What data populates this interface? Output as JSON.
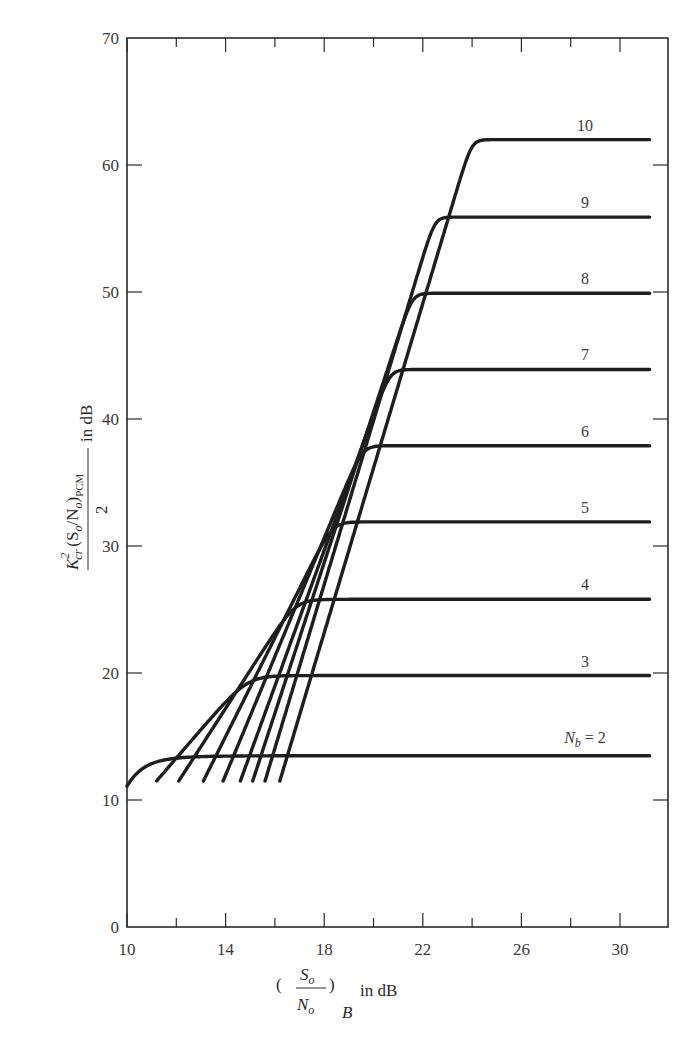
{
  "chart_data": {
    "type": "line",
    "title": "",
    "xlabel": "(S_o / N_o)_B in dB",
    "ylabel": "K_cr^2 (S_o/N_o)_PCM / 2 in dB",
    "xlim": [
      10,
      32
    ],
    "ylim": [
      0,
      70
    ],
    "x_ticks": [
      10,
      14,
      18,
      22,
      26,
      30
    ],
    "x_minor_ticks": [
      12,
      16,
      20,
      24,
      28
    ],
    "y_ticks": [
      0,
      10,
      20,
      30,
      40,
      50,
      60,
      70
    ],
    "grid": false,
    "legend": "inline labels above each plateau",
    "series": [
      {
        "name": "N_b = 2",
        "label": "N_b = 2",
        "x_start": 10.0,
        "y_start": 11.2,
        "x_knee": 13.5,
        "plateau": 13.8,
        "x_end": 31.2
      },
      {
        "name": "3",
        "label": "3",
        "x_start": 11.2,
        "y_start": 11.5,
        "x_knee": 15.7,
        "plateau": 19.8,
        "x_end": 31.2
      },
      {
        "name": "4",
        "label": "4",
        "x_start": 12.1,
        "y_start": 11.5,
        "x_knee": 17.9,
        "plateau": 25.8,
        "x_end": 31.2
      },
      {
        "name": "5",
        "label": "5",
        "x_start": 13.1,
        "y_start": 11.5,
        "x_knee": 19.5,
        "plateau": 31.9,
        "x_end": 31.2
      },
      {
        "name": "6",
        "label": "6",
        "x_start": 13.9,
        "y_start": 11.5,
        "x_knee": 20.8,
        "plateau": 37.9,
        "x_end": 31.2
      },
      {
        "name": "7",
        "label": "7",
        "x_start": 14.6,
        "y_start": 11.5,
        "x_knee": 22.0,
        "plateau": 43.9,
        "x_end": 31.2
      },
      {
        "name": "8",
        "label": "8",
        "x_start": 15.1,
        "y_start": 11.5,
        "x_knee": 23.0,
        "plateau": 49.9,
        "x_end": 31.2
      },
      {
        "name": "9",
        "label": "9",
        "x_start": 15.6,
        "y_start": 11.5,
        "x_knee": 24.0,
        "plateau": 55.9,
        "x_end": 31.2
      },
      {
        "name": "10",
        "label": "10",
        "x_start": 16.2,
        "y_start": 11.5,
        "x_knee": 25.7,
        "plateau": 62.0,
        "x_end": 31.2
      }
    ]
  },
  "axes": {
    "x_label_main": "in dB",
    "x_label_num": "S",
    "x_label_num_sub": "o",
    "x_label_den": "N",
    "x_label_den_sub": "o",
    "x_label_outer_sub": "B",
    "y_label_num": "K",
    "y_label_num_sup": "2",
    "y_label_num_sub": "cr",
    "y_label_mid": "(S",
    "y_label_mid_sub": "o",
    "y_label_mid2": "/N",
    "y_label_mid2_sub": "o",
    "y_label_mid3": ")",
    "y_label_pcm": "PCM",
    "y_label_den": "2",
    "y_label_unit": "in dB"
  },
  "caption": {
    "text": "Figure 4.5.x   Performance of a bit-rate-code NRZ-PCM system, plotted as a function of N_b"
  }
}
